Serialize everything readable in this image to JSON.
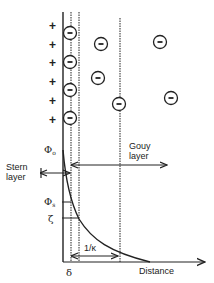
{
  "diagram": {
    "labels": {
      "stern_layer_line1": "Stern",
      "stern_layer_line2": "layer",
      "gouy_layer_line1": "Gouy",
      "gouy_layer_line2": "layer",
      "phi_0": "Φ",
      "phi_0_sub": "o",
      "phi_s": "Φ",
      "phi_s_sub": "s",
      "zeta": "ζ",
      "debye_length": "1/κ",
      "delta": "δ",
      "distance_axis": "Distance"
    },
    "charges": {
      "surface_sign": "+",
      "surface_count": 6,
      "adsorbed_anion_sign": "−",
      "adsorbed_anion_count": 4,
      "free_anion_sign": "−",
      "free_anion_count": 5
    },
    "colors": {
      "ink": "#222222",
      "background": "#ffffff"
    }
  }
}
